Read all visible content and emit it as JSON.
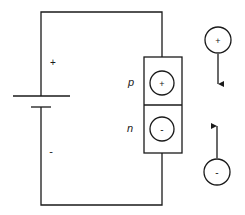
{
  "diagram": {
    "type": "circuit",
    "colors": {
      "line": "#1a1a1a",
      "background": "#ffffff"
    },
    "battery": {
      "positive_label": "+",
      "negative_label": "-"
    },
    "junction": {
      "p_region": {
        "label": "p",
        "carrier_sign": "+"
      },
      "n_region": {
        "label": "n",
        "carrier_sign": "-"
      }
    },
    "carriers": [
      {
        "name": "hole",
        "sign": "+",
        "arrow_direction": "down"
      },
      {
        "name": "electron",
        "sign": "-",
        "arrow_direction": "up"
      }
    ]
  }
}
